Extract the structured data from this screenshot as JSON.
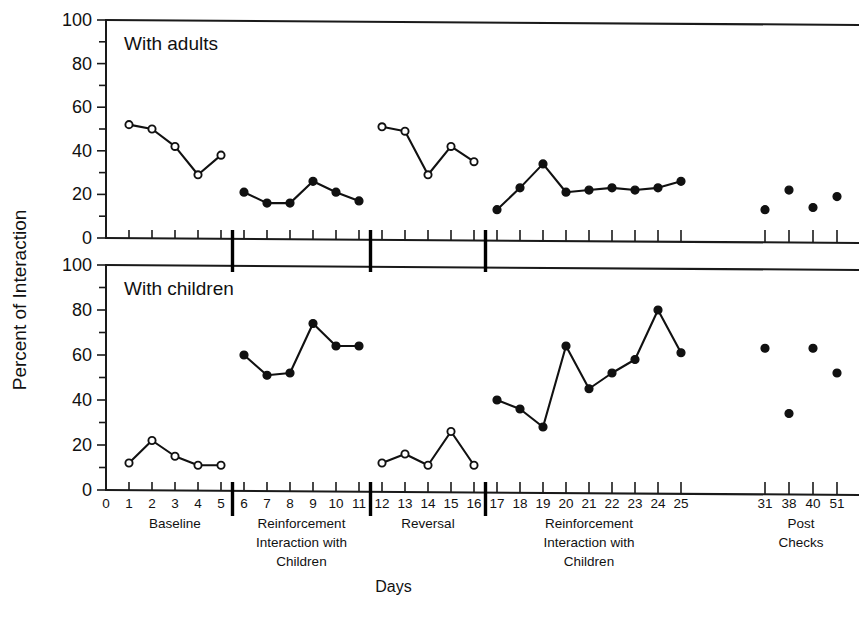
{
  "figure": {
    "y_axis_label": "Percent of Interaction",
    "x_axis_label": "Days",
    "panels": [
      {
        "title": "With adults"
      },
      {
        "title": "With children"
      }
    ],
    "y_ticks": [
      "0",
      "20",
      "40",
      "60",
      "80",
      "100"
    ],
    "x_tick_labels": [
      "0",
      "1",
      "2",
      "3",
      "4",
      "5",
      "6",
      "7",
      "8",
      "9",
      "10",
      "11",
      "12",
      "13",
      "14",
      "15",
      "16",
      "17",
      "18",
      "19",
      "20",
      "21",
      "22",
      "23",
      "24",
      "25",
      "31",
      "38",
      "40",
      "51"
    ],
    "phases": [
      {
        "name": "baseline",
        "label": "Baseline"
      },
      {
        "name": "reinforcement-1",
        "label": "Reinforcement\nInteraction with\nChildren"
      },
      {
        "name": "reversal",
        "label": "Reversal"
      },
      {
        "name": "reinforcement-2",
        "label": "Reinforcement\nInteraction with\nChildren"
      },
      {
        "name": "post-checks",
        "label": "Post\nChecks"
      }
    ],
    "caption": ""
  },
  "chart_data": {
    "type": "line",
    "xlabel": "Days",
    "ylabel": "Percent of Interaction",
    "xlim": [
      0,
      52
    ],
    "ylim": [
      0,
      100
    ],
    "grid": false,
    "legend": "none",
    "marker_key": {
      "open_circle": "baseline / reversal (non-reinforcement) sessions",
      "filled_circle": "reinforcement sessions and post checks"
    },
    "x_ticks": [
      0,
      1,
      2,
      3,
      4,
      5,
      6,
      7,
      8,
      9,
      10,
      11,
      12,
      13,
      14,
      15,
      16,
      17,
      18,
      19,
      20,
      21,
      22,
      23,
      24,
      25,
      31,
      38,
      40,
      51
    ],
    "phase_boundaries_after_day": [
      5,
      11,
      16,
      25
    ],
    "panels": [
      {
        "name": "with-adults",
        "title": "With adults",
        "ylim": [
          0,
          100
        ],
        "segments": [
          {
            "phase": "Baseline",
            "marker": "open",
            "connected": true,
            "x": [
              1,
              2,
              3,
              4,
              5
            ],
            "y": [
              52,
              50,
              42,
              29,
              38
            ]
          },
          {
            "phase": "Reinforcement Interaction with Children",
            "marker": "filled",
            "connected": true,
            "x": [
              6,
              7,
              8,
              9,
              10,
              11
            ],
            "y": [
              21,
              16,
              16,
              26,
              21,
              17
            ]
          },
          {
            "phase": "Reversal",
            "marker": "open",
            "connected": true,
            "x": [
              12,
              13,
              14,
              15,
              16
            ],
            "y": [
              51,
              49,
              29,
              42,
              35
            ]
          },
          {
            "phase": "Reinforcement Interaction with Children",
            "marker": "filled",
            "connected": true,
            "x": [
              17,
              18,
              19,
              20,
              21,
              22,
              23,
              24,
              25
            ],
            "y": [
              13,
              23,
              34,
              21,
              22,
              23,
              22,
              23,
              26
            ]
          },
          {
            "phase": "Post Checks",
            "marker": "filled",
            "connected": false,
            "x": [
              31,
              38,
              40,
              51
            ],
            "y": [
              13,
              22,
              14,
              19
            ]
          }
        ]
      },
      {
        "name": "with-children",
        "title": "With children",
        "ylim": [
          0,
          100
        ],
        "segments": [
          {
            "phase": "Baseline",
            "marker": "open",
            "connected": true,
            "x": [
              1,
              2,
              3,
              4,
              5
            ],
            "y": [
              12,
              22,
              15,
              11,
              11
            ]
          },
          {
            "phase": "Reinforcement Interaction with Children",
            "marker": "filled",
            "connected": true,
            "x": [
              6,
              7,
              8,
              9,
              10,
              11
            ],
            "y": [
              60,
              51,
              52,
              74,
              64,
              64
            ]
          },
          {
            "phase": "Reversal",
            "marker": "open",
            "connected": true,
            "x": [
              12,
              13,
              14,
              15,
              16
            ],
            "y": [
              12,
              16,
              11,
              26,
              11
            ]
          },
          {
            "phase": "Reinforcement Interaction with Children",
            "marker": "filled",
            "connected": true,
            "x": [
              17,
              18,
              19,
              20,
              21,
              22,
              23,
              24,
              25
            ],
            "y": [
              40,
              36,
              28,
              64,
              45,
              52,
              58,
              80,
              61
            ]
          },
          {
            "phase": "Post Checks",
            "marker": "filled",
            "connected": false,
            "x": [
              31,
              38,
              40,
              51
            ],
            "y": [
              63,
              34,
              63,
              52
            ]
          }
        ]
      }
    ]
  }
}
